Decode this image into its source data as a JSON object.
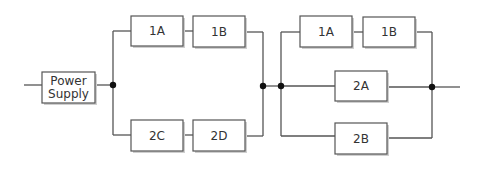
{
  "diagram": {
    "type": "reliability-block-diagram",
    "blocks": {
      "power_supply": {
        "line1": "Power",
        "line2": "Supply"
      },
      "left_1a": "1A",
      "left_1b": "1B",
      "left_2c": "2C",
      "left_2d": "2D",
      "right_1a": "1A",
      "right_1b": "1B",
      "right_2a": "2A",
      "right_2b": "2B"
    },
    "colors": {
      "line": "#555555",
      "junction": "#111111",
      "box_fill": "#ffffff",
      "shadow": "#cfcfcf"
    }
  }
}
